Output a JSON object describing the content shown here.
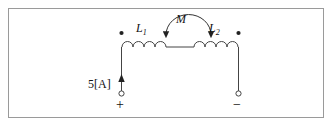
{
  "figure": {
    "type": "circuit-diagram",
    "border_color": "#9a9a9a",
    "line_color": "#444444",
    "text_color": "#111111"
  },
  "labels": {
    "inductor_left": "L",
    "inductor_left_sub": "1",
    "inductor_right": "L",
    "inductor_right_sub": "2",
    "mutual": "M",
    "source": "5[A]",
    "terminal_positive": "+",
    "terminal_negative": "−"
  },
  "components": [
    {
      "name": "inductor-L1",
      "label": "L1",
      "dot_marker": "top-left"
    },
    {
      "name": "inductor-L2",
      "label": "L2",
      "dot_marker": "top-right"
    },
    {
      "name": "mutual-coupling",
      "label": "M",
      "arrow": "double-headed-arc"
    },
    {
      "name": "current-source",
      "label": "5[A]",
      "direction": "up"
    }
  ],
  "terminals": [
    {
      "name": "terminal-left",
      "polarity": "+"
    },
    {
      "name": "terminal-right",
      "polarity": "−"
    }
  ]
}
